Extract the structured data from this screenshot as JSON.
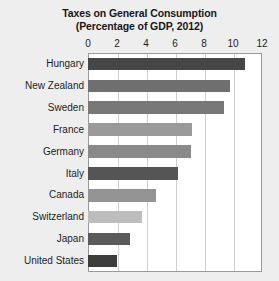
{
  "chart_data": {
    "type": "bar",
    "orientation": "horizontal",
    "title": "Taxes on General Consumption",
    "subtitle": "(Percentage of GDP, 2012)",
    "xlabel": "",
    "ylabel": "",
    "xlim": [
      0,
      12
    ],
    "xticks": [
      0,
      2,
      4,
      6,
      8,
      10,
      12
    ],
    "xtick_labels": [
      "0",
      "2",
      "4",
      "6",
      "8",
      "10",
      "12"
    ],
    "grid": true,
    "grid_axis": "x",
    "legend": false,
    "categories": [
      "Hungary",
      "New Zealand",
      "Sweden",
      "France",
      "Germany",
      "Italy",
      "Canada",
      "Switzerland",
      "Japan",
      "United States"
    ],
    "values": [
      10.8,
      9.8,
      9.4,
      7.2,
      7.1,
      6.2,
      4.7,
      3.7,
      2.9,
      2.0
    ],
    "bar_colors": [
      "#464646",
      "#6f6f6f",
      "#787878",
      "#9a9a9a",
      "#8a8a8a",
      "#555555",
      "#949494",
      "#bdbdbd",
      "#5a5a5a",
      "#3c3c3c"
    ]
  },
  "colors": {
    "page_background": "#eeeeee",
    "plot_background": "#ffffff",
    "frame": "#9a9a9a",
    "gridline": "#cfcfcf",
    "text": "#1d1d20"
  }
}
